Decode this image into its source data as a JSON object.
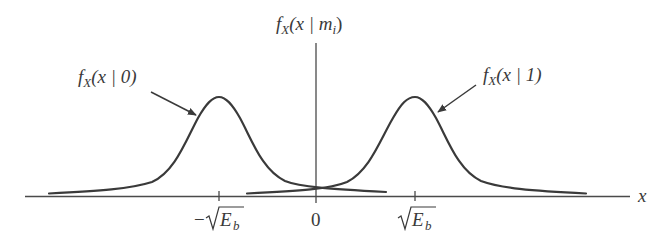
{
  "diagram": {
    "type": "conditional-pdf-plot",
    "x_axis": {
      "label": "x",
      "ticks": [
        {
          "label_prefix": "−",
          "label_main": "E",
          "label_sub": "b",
          "has_sqrt": true,
          "value": "-sqrt(E_b)"
        },
        {
          "label_main": "0",
          "value": "0"
        },
        {
          "label_prefix": "",
          "label_main": "E",
          "label_sub": "b",
          "has_sqrt": true,
          "value": "sqrt(E_b)"
        }
      ]
    },
    "y_axis": {
      "label_f": "f",
      "label_sub": "X",
      "label_args": "(x | m",
      "label_args_sub": "i",
      "label_close": ")"
    },
    "curves": [
      {
        "name": "f_X(x|0)",
        "label_f": "f",
        "label_sub": "X",
        "label_args": "(x | 0)",
        "center": "-sqrt(E_b)"
      },
      {
        "name": "f_X(x|1)",
        "label_f": "f",
        "label_sub": "X",
        "label_args": "(x | 1)",
        "center": "sqrt(E_b)"
      }
    ],
    "colors": {
      "line": "#3a3a3a",
      "axis": "#4a4a4a",
      "background": "#ffffff"
    }
  }
}
